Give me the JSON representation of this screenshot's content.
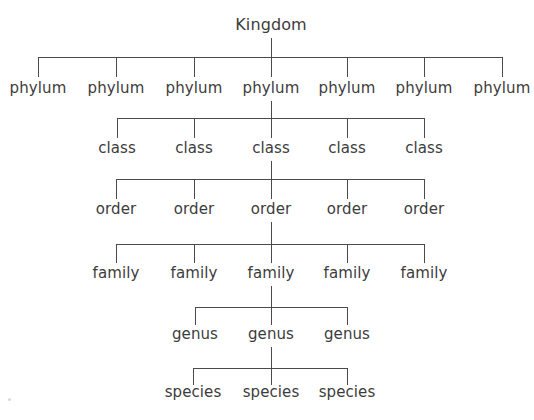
{
  "diagram": {
    "background_color": "#ffffff",
    "line_color": "#4a4a4a",
    "text_color": "#3c3c3c",
    "root": {
      "label": "Kingdom",
      "x": 271,
      "y": 33
    },
    "levels": [
      {
        "name": "phylum",
        "label": "phylum",
        "count": 7,
        "label_y": 96,
        "bar_y": 57,
        "tick_top": 57,
        "tick_bottom": 77,
        "stem_top": 38,
        "stem_bottom": 57,
        "positions": [
          38,
          116,
          194,
          271,
          347,
          424,
          502
        ],
        "labels": [
          "phylum",
          "phylum",
          "phylum",
          "phylum",
          "phylum",
          "phylum",
          "phylum"
        ]
      },
      {
        "name": "class",
        "label": "class",
        "count": 5,
        "label_y": 156,
        "bar_y": 118,
        "tick_top": 118,
        "tick_bottom": 138,
        "stem_top": 101,
        "stem_bottom": 118,
        "positions": [
          117,
          194,
          271,
          347,
          424
        ],
        "labels": [
          "class",
          "class",
          "class",
          "class",
          "class"
        ]
      },
      {
        "name": "order",
        "label": "order",
        "count": 5,
        "label_y": 217,
        "bar_y": 179,
        "tick_top": 179,
        "tick_bottom": 199,
        "stem_top": 161,
        "stem_bottom": 179,
        "positions": [
          116,
          194,
          271,
          347,
          424
        ],
        "labels": [
          "order",
          "order",
          "order",
          "order",
          "order"
        ]
      },
      {
        "name": "family",
        "label": "family",
        "count": 5,
        "label_y": 281,
        "bar_y": 244,
        "tick_top": 244,
        "tick_bottom": 263,
        "stem_top": 222,
        "stem_bottom": 244,
        "positions": [
          116,
          194,
          271,
          347,
          424
        ],
        "labels": [
          "family",
          "family",
          "family",
          "family",
          "family"
        ]
      },
      {
        "name": "genus",
        "label": "genus",
        "count": 3,
        "label_y": 342,
        "bar_y": 307,
        "tick_top": 307,
        "tick_bottom": 325,
        "stem_top": 286,
        "stem_bottom": 307,
        "positions": [
          195,
          271,
          347
        ],
        "labels": [
          "genus",
          "genus",
          "genus"
        ]
      },
      {
        "name": "species",
        "label": "species",
        "count": 3,
        "label_y": 400,
        "bar_y": 368,
        "tick_top": 368,
        "tick_bottom": 385,
        "stem_top": 347,
        "stem_bottom": 368,
        "positions": [
          193,
          271,
          347
        ],
        "labels": [
          "species",
          "species",
          "species"
        ]
      }
    ]
  }
}
